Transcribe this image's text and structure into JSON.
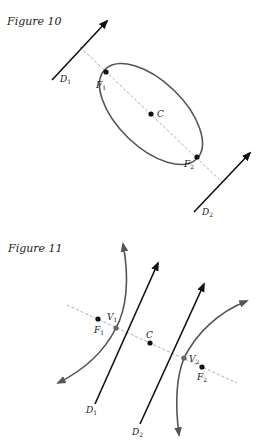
{
  "figures": [
    {
      "caption": "Figure 10",
      "shape": "ellipse",
      "points": {
        "F1": {
          "label": "F",
          "sub": "1"
        },
        "F2": {
          "label": "F",
          "sub": "2"
        },
        "C": {
          "label": "C"
        }
      },
      "directrices": [
        {
          "label": "D",
          "sub": "1"
        },
        {
          "label": "D",
          "sub": "2"
        }
      ]
    },
    {
      "caption": "Figure 11",
      "shape": "hyperbola",
      "points": {
        "F1": {
          "label": "F",
          "sub": "1"
        },
        "F2": {
          "label": "F",
          "sub": "2"
        },
        "V1": {
          "label": "V",
          "sub": "1"
        },
        "V2": {
          "label": "V",
          "sub": "2"
        },
        "C": {
          "label": "C"
        }
      },
      "directrices": [
        {
          "label": "D",
          "sub": "1"
        },
        {
          "label": "D",
          "sub": "2"
        }
      ]
    }
  ],
  "colors": {
    "ink": "#111111",
    "curve": "#555555",
    "axis": "#999999"
  }
}
